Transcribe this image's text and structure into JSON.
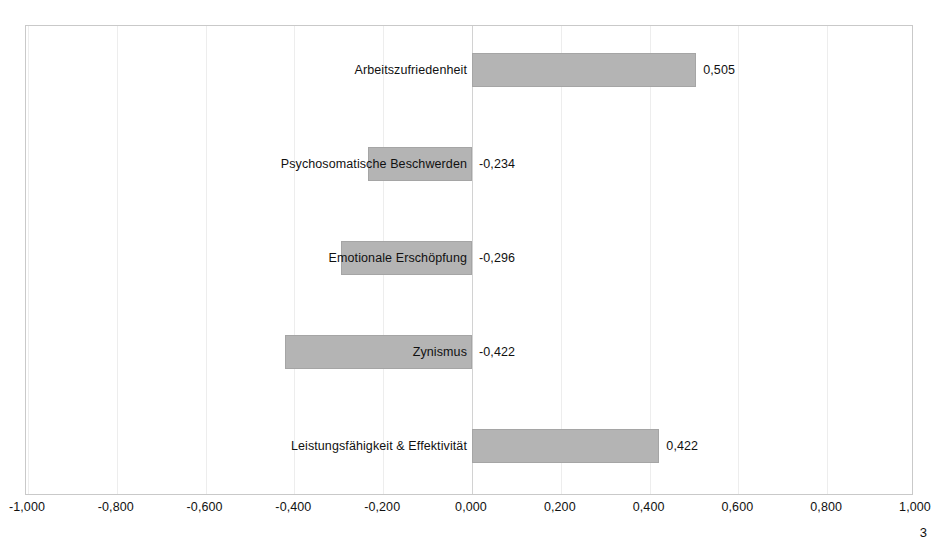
{
  "chart_data": {
    "type": "bar",
    "orientation": "horizontal",
    "title": "",
    "subtitle": "",
    "xlabel": "",
    "ylabel": "",
    "xlim": [
      -1.0,
      1.0
    ],
    "grid": true,
    "legend": false,
    "legend_position": "none",
    "bar_color": "#b4b4b4",
    "bar_edge_color": "#a5a5a5",
    "categories": [
      "Arbeitszufriedenheit",
      "Psychosomatische Beschwerden",
      "Emotionale Erschöpfung",
      "Zynismus",
      "Leistungsfähigkeit & Effektivität"
    ],
    "values": [
      0.505,
      -0.234,
      -0.296,
      -0.422,
      0.422
    ],
    "value_labels": [
      "0,505",
      "-0,234",
      "-0,296",
      "-0,422",
      "0,422"
    ],
    "x_ticks": [
      -1.0,
      -0.8,
      -0.6,
      -0.4,
      -0.2,
      0.0,
      0.2,
      0.4,
      0.6,
      0.8,
      1.0
    ],
    "x_tick_labels": [
      "-1,000",
      "-0,800",
      "-0,600",
      "-0,400",
      "-0,200",
      "0,000",
      "0,200",
      "0,400",
      "0,600",
      "0,800",
      "1,000"
    ]
  },
  "footer": {
    "page_number": "3"
  }
}
